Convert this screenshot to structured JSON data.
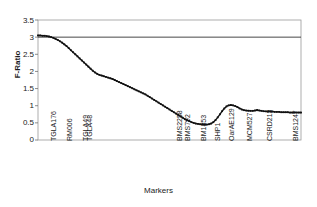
{
  "chart_data": {
    "type": "line",
    "title": "",
    "xlabel": "Markers",
    "ylabel": "F-Ratio",
    "ylim": [
      0,
      3.5
    ],
    "ytick_labels": [
      "0",
      "0.5",
      "1",
      "1.5",
      "2",
      "2.5",
      "3",
      "3.5"
    ],
    "ytick_values": [
      0,
      0.5,
      1,
      1.5,
      2,
      2.5,
      3,
      3.5
    ],
    "grid": false,
    "legend": "none",
    "reference_lines": [
      {
        "orientation": "horizontal",
        "value": 3.0,
        "color": "#333333"
      }
    ],
    "marker_labels": [
      "TGLA176",
      "RM006",
      "TGLA49",
      "TGLA48",
      "BMS2258",
      "BMS792",
      "BM1853",
      "SHP1",
      "OarAE129",
      "MCM527",
      "CSRD213",
      "BMS1247"
    ],
    "marker_label_positions": [
      50,
      66,
      82,
      86,
      176,
      184,
      200,
      214,
      228,
      246,
      266,
      292
    ],
    "series": [
      {
        "name": "F-Ratio",
        "color": "#111111",
        "x": [
          0,
          1,
          2,
          3,
          4,
          5,
          6,
          7,
          8,
          9,
          10,
          11,
          12,
          13,
          14,
          15,
          16,
          17,
          18,
          19,
          20,
          21,
          22,
          23,
          24,
          25,
          26,
          27,
          28,
          29,
          30,
          31,
          32,
          33,
          34,
          35,
          36,
          37,
          38,
          39,
          40,
          41,
          42,
          43,
          44,
          45,
          46,
          47,
          48,
          49,
          50,
          51,
          52,
          53,
          54,
          55,
          56,
          57,
          58,
          59,
          60,
          61,
          62,
          63,
          64,
          65,
          66,
          67,
          68,
          69,
          70,
          71,
          72,
          73,
          74,
          75,
          76,
          77,
          78,
          79,
          80,
          81,
          82,
          83,
          84,
          85,
          86,
          87,
          88,
          89,
          90,
          91,
          92,
          93,
          94,
          95,
          96,
          97,
          98,
          99,
          100
        ],
        "values": [
          3.05,
          3.05,
          3.04,
          3.04,
          3.03,
          3.02,
          3.0,
          2.98,
          2.95,
          2.92,
          2.88,
          2.84,
          2.79,
          2.74,
          2.68,
          2.62,
          2.56,
          2.5,
          2.44,
          2.38,
          2.32,
          2.26,
          2.2,
          2.14,
          2.08,
          2.02,
          1.97,
          1.93,
          1.9,
          1.88,
          1.86,
          1.84,
          1.82,
          1.8,
          1.78,
          1.75,
          1.72,
          1.69,
          1.66,
          1.63,
          1.6,
          1.57,
          1.54,
          1.51,
          1.48,
          1.45,
          1.42,
          1.39,
          1.36,
          1.33,
          1.29,
          1.25,
          1.21,
          1.17,
          1.13,
          1.09,
          1.05,
          1.01,
          0.97,
          0.93,
          0.89,
          0.85,
          0.81,
          0.77,
          0.73,
          0.69,
          0.65,
          0.61,
          0.58,
          0.55,
          0.52,
          0.5,
          0.48,
          0.47,
          0.46,
          0.455,
          0.45,
          0.45,
          0.46,
          0.48,
          0.52,
          0.58,
          0.66,
          0.75,
          0.84,
          0.92,
          0.98,
          1.01,
          1.02,
          1.01,
          0.99,
          0.96,
          0.92,
          0.89,
          0.87,
          0.86,
          0.855,
          0.85,
          0.85,
          0.86,
          0.87
        ]
      },
      {
        "name": "F-Ratio-tail",
        "color": "#111111",
        "x": [
          100,
          101,
          102,
          103,
          104,
          105,
          106,
          107,
          108,
          109,
          110,
          111,
          112,
          113,
          114,
          115,
          116,
          117,
          118,
          119,
          120
        ],
        "values": [
          0.87,
          0.86,
          0.85,
          0.84,
          0.835,
          0.83,
          0.83,
          0.83,
          0.82,
          0.82,
          0.82,
          0.81,
          0.81,
          0.81,
          0.81,
          0.8,
          0.8,
          0.8,
          0.8,
          0.8,
          0.8
        ]
      }
    ]
  }
}
